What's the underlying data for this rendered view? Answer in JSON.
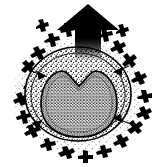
{
  "figure": {
    "title": "Cell cross-section with emerging arrow",
    "canvas": {
      "width": 158,
      "height": 167
    },
    "background_color": "#ffffff",
    "ink_color": "#000000",
    "caption": "",
    "elements": {
      "arrow": {
        "name": "upward arrow",
        "label": "",
        "direction": "up",
        "color": "#000000",
        "tip_x": 88,
        "tip_y": 4,
        "base_y": 58,
        "head_half_width": 31,
        "shaft_half_width": 13,
        "head_base_y": 28,
        "fade": "bottom"
      },
      "outer_halo": {
        "name": "stippled outer halo",
        "center_x": 78,
        "center_y": 95,
        "radius_x": 68,
        "radius_y": 62,
        "stipple_density": "sparse",
        "color": "#1a1a1a"
      },
      "cell_body": {
        "name": "cell body",
        "center_x": 78,
        "center_y": 94,
        "radius_x": 53,
        "radius_y": 47,
        "outline_color": "#000000",
        "fill": "stipple-medium"
      },
      "inner_membrane": {
        "name": "inner membrane ring",
        "center_x": 78,
        "center_y": 95,
        "radius_x": 47,
        "radius_y": 42
      },
      "nucleus": {
        "name": "notched nucleus",
        "center_x": 79,
        "center_y": 105,
        "width": 78,
        "height": 62,
        "notch_depth": 14,
        "fill": "stipple-dense",
        "outline_color": "#000000"
      },
      "microbe_ring": {
        "name": "surrounding squiggle ring",
        "count": 22,
        "center_x": 78,
        "center_y": 92,
        "radius_x": 70,
        "radius_y": 70,
        "color": "#000000",
        "description": "irregular zigzag marks encircling the cell"
      },
      "pointer_arrows": {
        "name": "inward pointer arrows",
        "count": 4,
        "color": "#000000",
        "positions": [
          {
            "x": 30,
            "y": 72,
            "angle": 200
          },
          {
            "x": 26,
            "y": 122,
            "angle": 330
          },
          {
            "x": 128,
            "y": 118,
            "angle": 160
          },
          {
            "x": 126,
            "y": 70,
            "angle": 20
          }
        ]
      }
    }
  }
}
